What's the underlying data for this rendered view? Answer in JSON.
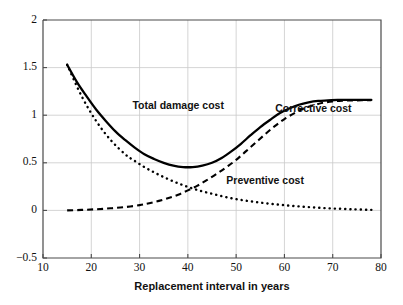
{
  "chart_data": {
    "type": "line",
    "title": "",
    "xlabel": "Replacement interval in years",
    "ylabel": "",
    "xlim": [
      10,
      80
    ],
    "ylim": [
      -0.5,
      2
    ],
    "xticks": [
      "10",
      "20",
      "30",
      "40",
      "50",
      "60",
      "70",
      "80"
    ],
    "yticks": [
      "2",
      "1.5",
      "1",
      "0.5",
      "0",
      "-0.5"
    ],
    "ytick_display": [
      "2",
      "1.5",
      "1",
      "0.5",
      "0",
      "−0.5"
    ],
    "grid": true,
    "legend_position": "inline-annotations",
    "series": [
      {
        "name": "Total damage cost",
        "style": "solid",
        "annotation_x": 38,
        "annotation_y": 1.06,
        "x": [
          15,
          17,
          19,
          21,
          23,
          25,
          27,
          29,
          31,
          33,
          35,
          37,
          39,
          41,
          43,
          45,
          47,
          49,
          51,
          53,
          55,
          57,
          59,
          61,
          63,
          65,
          67,
          69,
          71,
          73,
          75,
          78
        ],
        "y": [
          1.53,
          1.35,
          1.2,
          1.06,
          0.94,
          0.83,
          0.74,
          0.66,
          0.59,
          0.54,
          0.5,
          0.47,
          0.455,
          0.455,
          0.47,
          0.5,
          0.55,
          0.62,
          0.7,
          0.79,
          0.875,
          0.95,
          1.02,
          1.07,
          1.11,
          1.135,
          1.15,
          1.155,
          1.16,
          1.16,
          1.16,
          1.16
        ]
      },
      {
        "name": "Corrective cost",
        "style": "dashed",
        "annotation_x": 66,
        "annotation_y": 1.03,
        "x": [
          15,
          18,
          21,
          24,
          27,
          30,
          32,
          34,
          36,
          38,
          40,
          42,
          44,
          46,
          48,
          50,
          52,
          54,
          56,
          58,
          60,
          62,
          64,
          66,
          68,
          70,
          72,
          74,
          76,
          78
        ],
        "y": [
          0.0,
          0.005,
          0.012,
          0.022,
          0.035,
          0.055,
          0.075,
          0.1,
          0.13,
          0.165,
          0.21,
          0.26,
          0.32,
          0.385,
          0.455,
          0.53,
          0.62,
          0.71,
          0.8,
          0.885,
          0.96,
          1.02,
          1.07,
          1.105,
          1.13,
          1.145,
          1.152,
          1.155,
          1.157,
          1.157
        ]
      },
      {
        "name": "Preventive cost",
        "style": "dotted",
        "annotation_x": 56,
        "annotation_y": 0.28,
        "x": [
          15,
          18,
          21,
          24,
          27,
          29,
          31,
          33,
          35,
          37,
          39,
          41,
          43,
          45,
          47,
          49,
          51,
          53,
          55,
          57,
          59,
          61,
          63,
          65,
          67,
          69,
          71,
          73,
          75,
          78
        ],
        "y": [
          1.53,
          1.2,
          0.94,
          0.74,
          0.59,
          0.52,
          0.455,
          0.4,
          0.35,
          0.305,
          0.265,
          0.23,
          0.2,
          0.175,
          0.15,
          0.128,
          0.11,
          0.095,
          0.082,
          0.07,
          0.06,
          0.05,
          0.042,
          0.035,
          0.028,
          0.022,
          0.018,
          0.014,
          0.01,
          0.006
        ]
      }
    ]
  },
  "colors": {
    "curve": "#000000",
    "grid": "#c9c9c9",
    "frame": "#4a4a4a",
    "background": "#ffffff"
  }
}
